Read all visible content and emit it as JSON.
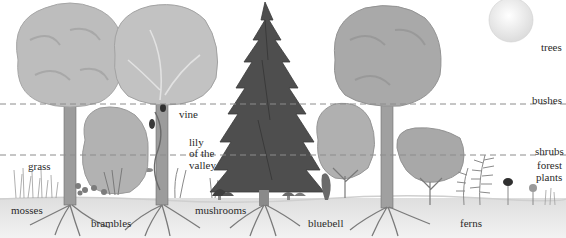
{
  "diagram": {
    "colors": {
      "background": "#ffffff",
      "foliage_light": "#b9b9b9",
      "foliage_mid": "#9a9a9a",
      "conifer": "#4a4a4a",
      "trunk": "#8a8a8a",
      "ground": "#e6e6e6",
      "dashed_line": "#8c8c8c",
      "sun": "#f1f1f1",
      "label_text": "#2a2a2a"
    },
    "layer_labels": {
      "trees": "trees",
      "bushes": "bushes",
      "shrubs": "shrubs",
      "forest_plants_line1": "forest",
      "forest_plants_line2": "plants"
    },
    "plant_labels": {
      "grass": "grass",
      "mosses": "mosses",
      "brambles": "brambles",
      "vine": "vine",
      "lily_line1": "lily",
      "lily_line2": "of the",
      "lily_line3": "valley",
      "mushrooms": "mushrooms",
      "bluebell": "bluebell",
      "ferns": "ferns"
    },
    "divider_lines": [
      {
        "name": "bushes-boundary",
        "y": 104
      },
      {
        "name": "shrubs-boundary",
        "y": 155
      }
    ]
  }
}
